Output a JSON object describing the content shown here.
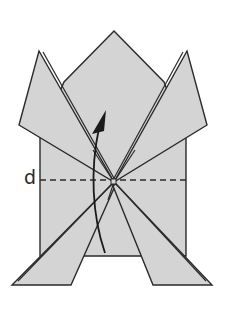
{
  "diagram": {
    "fold_line_label": "d",
    "colors": {
      "paper": "#d4d4d4",
      "outline": "#2a2a2a",
      "background": "#ffffff"
    },
    "elements": [
      {
        "name": "center-body",
        "shape": "pentagon"
      },
      {
        "name": "left-upper-flap",
        "shape": "kite"
      },
      {
        "name": "right-upper-flap",
        "shape": "kite"
      },
      {
        "name": "left-lower-flap",
        "shape": "trapezoid"
      },
      {
        "name": "right-lower-flap",
        "shape": "trapezoid"
      },
      {
        "name": "fold-line-d",
        "shape": "dashed-line"
      },
      {
        "name": "lift-arrow",
        "shape": "curved-arrow",
        "direction": "up"
      }
    ]
  }
}
